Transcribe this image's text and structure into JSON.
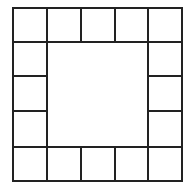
{
  "diagram": {
    "grid_size": 5,
    "line_color": "#222222",
    "background": "#ffffff",
    "col_edges": [
      13,
      47,
      81,
      115,
      148,
      182
    ],
    "row_edges": [
      8,
      42,
      76,
      111,
      147,
      181
    ],
    "cells": [
      {
        "row": 0,
        "col": 0
      },
      {
        "row": 0,
        "col": 1
      },
      {
        "row": 0,
        "col": 2
      },
      {
        "row": 0,
        "col": 3
      },
      {
        "row": 0,
        "col": 4
      },
      {
        "row": 1,
        "col": 0
      },
      {
        "row": 1,
        "col": 4
      },
      {
        "row": 2,
        "col": 0
      },
      {
        "row": 2,
        "col": 4
      },
      {
        "row": 3,
        "col": 0
      },
      {
        "row": 3,
        "col": 4
      },
      {
        "row": 4,
        "col": 0
      },
      {
        "row": 4,
        "col": 1
      },
      {
        "row": 4,
        "col": 2
      },
      {
        "row": 4,
        "col": 3
      },
      {
        "row": 4,
        "col": 4
      }
    ],
    "center": {
      "row_start": 1,
      "row_end": 4,
      "col_start": 1,
      "col_end": 4
    }
  }
}
